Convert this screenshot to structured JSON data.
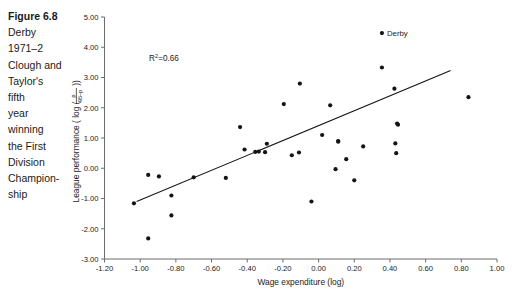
{
  "caption": {
    "title": "Figure 6.8",
    "body": "Derby 1971–2 Clough and Taylor's fifth year winning the First Division Champion-ship",
    "lines": [
      "Figure 6.8",
      "Derby",
      "1971–2",
      "Clough and",
      "Taylor's",
      "fifth",
      "year",
      "winning",
      "the First",
      "Division",
      "Champion-",
      "ship"
    ]
  },
  "chart_data": {
    "type": "scatter",
    "title": "",
    "xlabel": "Wage expenditure (log)",
    "ylabel": "League performance ( log ( p / 95–p ) )",
    "ylabel_parts": {
      "prefix": "League performance ( log (",
      "numerator": "p",
      "denominator": "95–p",
      "suffix": "))"
    },
    "xlim": [
      -1.2,
      1.0
    ],
    "ylim": [
      -3.0,
      5.0
    ],
    "xticks": [
      "-1.20",
      "-1.00",
      "-0.80",
      "-0.60",
      "-0.40",
      "-0.20",
      "0.00",
      "0.20",
      "0.40",
      "0.60",
      "0.80",
      "1.00"
    ],
    "xtick_values": [
      -1.2,
      -1.0,
      -0.8,
      -0.6,
      -0.4,
      -0.2,
      0.0,
      0.2,
      0.4,
      0.6,
      0.8,
      1.0
    ],
    "yticks": [
      "5.00",
      "4.00",
      "3.00",
      "2.00",
      "1.00",
      "0.00",
      "-1.00",
      "-2.00",
      "-3.00"
    ],
    "ytick_values": [
      5,
      4,
      3,
      2,
      1,
      0,
      -1,
      -2,
      -3
    ],
    "grid": false,
    "legend": "none",
    "annotations": [
      {
        "name": "r-squared",
        "text_prefix": "R",
        "text_sup": "2",
        "text_suffix": "=0.66",
        "x": -0.95,
        "y": 3.55
      }
    ],
    "point_labels": [
      {
        "name": "derby",
        "label": "Derby",
        "x": 0.355,
        "y": 4.47
      }
    ],
    "series": [
      {
        "name": "clubs",
        "marker": "filled-circle",
        "color": "#141414",
        "points": [
          [
            -1.035,
            -1.16
          ],
          [
            -0.955,
            -2.32
          ],
          [
            -0.955,
            -0.22
          ],
          [
            -0.895,
            -0.27
          ],
          [
            -0.825,
            -0.9
          ],
          [
            -0.825,
            -1.56
          ],
          [
            -0.7,
            -0.3
          ],
          [
            -0.52,
            -0.32
          ],
          [
            -0.44,
            1.36
          ],
          [
            -0.415,
            0.62
          ],
          [
            -0.355,
            0.54
          ],
          [
            -0.335,
            0.55
          ],
          [
            -0.3,
            0.53
          ],
          [
            -0.29,
            0.81
          ],
          [
            -0.195,
            2.12
          ],
          [
            -0.15,
            0.43
          ],
          [
            -0.11,
            0.52
          ],
          [
            -0.105,
            2.8
          ],
          [
            -0.04,
            -1.1
          ],
          [
            0.02,
            1.1
          ],
          [
            0.065,
            2.08
          ],
          [
            0.095,
            -0.03
          ],
          [
            0.11,
            0.9
          ],
          [
            0.11,
            0.88
          ],
          [
            0.155,
            0.3
          ],
          [
            0.2,
            -0.4
          ],
          [
            0.25,
            0.72
          ],
          [
            0.355,
            3.33
          ],
          [
            0.425,
            2.63
          ],
          [
            0.43,
            0.82
          ],
          [
            0.435,
            0.5
          ],
          [
            0.44,
            1.48
          ],
          [
            0.445,
            1.44
          ],
          [
            0.355,
            4.47
          ],
          [
            0.84,
            2.35
          ]
        ]
      }
    ],
    "trendline": {
      "name": "regression-line",
      "x0": -1.02,
      "y0": -1.1,
      "x1": 0.74,
      "y1": 3.23
    }
  }
}
